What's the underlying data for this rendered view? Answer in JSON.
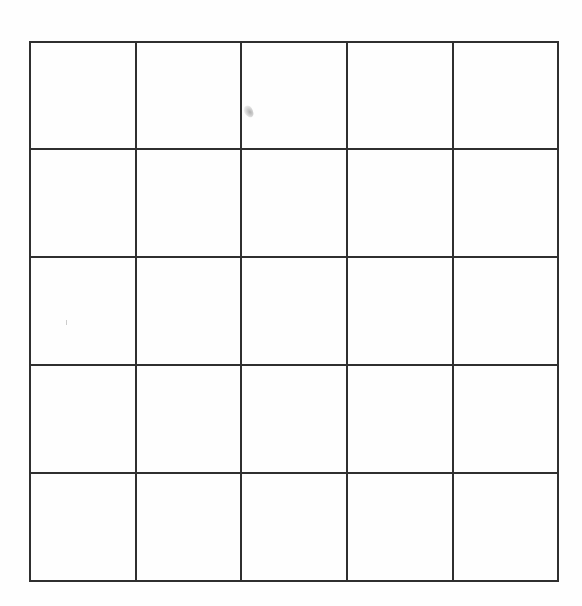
{
  "document": {
    "type": "blank-grid-worksheet",
    "background_color": "#ffffff",
    "grid": {
      "rows": 5,
      "columns": 5,
      "line_color": "#2f2f2f",
      "line_width_px": 2,
      "x_lines": [
        30,
        136,
        241,
        347,
        453,
        558
      ],
      "y_lines": [
        42,
        149,
        257,
        365,
        473,
        581
      ],
      "cells": [
        [
          "",
          "",
          "",
          "",
          ""
        ],
        [
          "",
          "",
          "",
          "",
          ""
        ],
        [
          "",
          "",
          "",
          "",
          ""
        ],
        [
          "",
          "",
          "",
          "",
          ""
        ],
        [
          "",
          "",
          "",
          "",
          ""
        ]
      ]
    },
    "marks": [
      {
        "kind": "pencil-smudge",
        "x": 249,
        "y": 112,
        "color": "#9a9a9a"
      }
    ]
  }
}
